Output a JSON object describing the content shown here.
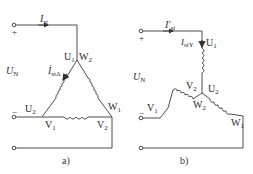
{
  "diagram_a": {
    "caption": "a)",
    "voltage_label": "U",
    "voltage_sub": "N",
    "current_label": "I",
    "current_sub": "st",
    "phase_current_label": "İ",
    "phase_current_sub": "stΔ",
    "plus": "+",
    "minus": "−",
    "nodes": {
      "top_left": {
        "main": "U",
        "sub": "1"
      },
      "top_right": {
        "main": "W",
        "sub": "2"
      },
      "left": {
        "main": "U",
        "sub": "2"
      },
      "bottom_left": {
        "main": "V",
        "sub": "1"
      },
      "bottom_right": {
        "main": "V",
        "sub": "2"
      },
      "right": {
        "main": "W",
        "sub": "1"
      }
    },
    "connection": "delta"
  },
  "diagram_b": {
    "caption": "b)",
    "voltage_label": "U",
    "voltage_sub": "N",
    "current_label": "I′",
    "current_sub": "st",
    "phase_current_label": "I",
    "phase_current_sub": "stY",
    "plus": "+",
    "minus": "−",
    "nodes": {
      "top": {
        "main": "U",
        "sub": "1"
      },
      "center_left": {
        "main": "V",
        "sub": "2"
      },
      "center_right": {
        "main": "U",
        "sub": "2"
      },
      "center_bottom": {
        "main": "W",
        "sub": "2"
      },
      "left": {
        "main": "V",
        "sub": "1"
      },
      "right": {
        "main": "W",
        "sub": "1"
      }
    },
    "connection": "star"
  },
  "colors": {
    "line": "#3a3a3a",
    "text": "#2a2a2a",
    "background": "#ffffff"
  }
}
